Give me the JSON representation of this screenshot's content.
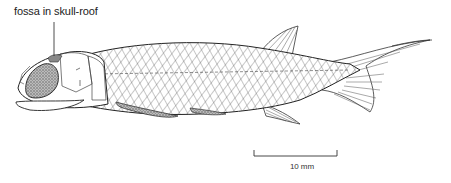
{
  "figure": {
    "annotations": [
      {
        "text": "fossa in skull-roof",
        "target": "skull-roof fossa"
      }
    ],
    "scale_bar": {
      "label": "10 mm",
      "length_px": 83
    }
  }
}
